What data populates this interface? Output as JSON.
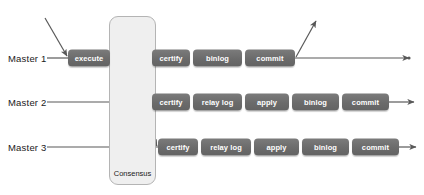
{
  "diagram": {
    "consensus": {
      "label": "Consensus",
      "x": 109,
      "y": 16,
      "width": 47,
      "height": 169,
      "label_x": 109,
      "label_y": 169,
      "label_width": 47
    },
    "rows": [
      {
        "id": "master-1",
        "label": "Master 1",
        "label_x": 8,
        "y": 58,
        "stages": [
          {
            "name": "execute",
            "x": 68,
            "width": 42
          },
          {
            "name": "certify",
            "x": 152,
            "width": 38
          },
          {
            "name": "binlog",
            "x": 193,
            "width": 49
          },
          {
            "name": "commit",
            "x": 245,
            "width": 50
          }
        ]
      },
      {
        "id": "master-2",
        "label": "Master 2",
        "label_x": 8,
        "y": 102,
        "stages": [
          {
            "name": "certify",
            "x": 152,
            "width": 38
          },
          {
            "name": "relay log",
            "x": 193,
            "width": 49
          },
          {
            "name": "apply",
            "x": 245,
            "width": 44
          },
          {
            "name": "binlog",
            "x": 292,
            "width": 47
          },
          {
            "name": "commit",
            "x": 342,
            "width": 47
          }
        ]
      },
      {
        "id": "master-3",
        "label": "Master 3",
        "label_x": 8,
        "y": 147,
        "stages": [
          {
            "name": "certify",
            "x": 158,
            "width": 40
          },
          {
            "name": "relay log",
            "x": 201,
            "width": 50
          },
          {
            "name": "apply",
            "x": 254,
            "width": 45
          },
          {
            "name": "binlog",
            "x": 302,
            "width": 47
          },
          {
            "name": "commit",
            "x": 352,
            "width": 47
          }
        ]
      }
    ],
    "connectors": [
      {
        "id": "input-arrow-master-1",
        "kind": "arrow",
        "x1": 45,
        "y1": 18,
        "x2": 67,
        "y2": 56
      },
      {
        "id": "label-line-master-1",
        "kind": "line",
        "x1": 47,
        "y1": 58,
        "x2": 68,
        "y2": 58
      },
      {
        "id": "label-line-master-2",
        "kind": "line",
        "x1": 47,
        "y1": 102,
        "x2": 152,
        "y2": 102
      },
      {
        "id": "label-line-master-3",
        "kind": "line",
        "x1": 47,
        "y1": 147,
        "x2": 158,
        "y2": 147
      },
      {
        "id": "execute-to-certify-master-1",
        "kind": "line",
        "x1": 110,
        "y1": 58,
        "x2": 152,
        "y2": 58
      },
      {
        "id": "consensus-arc-master-1",
        "kind": "arc",
        "x1": 112,
        "y1": 57,
        "cx": 132,
        "cy": 8,
        "x2": 150,
        "y2": 59
      },
      {
        "id": "execute-to-certify-master-2",
        "kind": "arrow",
        "x1": 113,
        "y1": 59,
        "x2": 151,
        "y2": 101
      },
      {
        "id": "execute-to-certify-master-3",
        "kind": "arrow",
        "x1": 113,
        "y1": 60,
        "x2": 157,
        "y2": 146
      },
      {
        "id": "commit-out-master-1",
        "kind": "arrow-dot",
        "x1": 295,
        "y1": 58,
        "x2": 409,
        "y2": 58
      },
      {
        "id": "commit-up-master-1",
        "kind": "arrow",
        "x1": 296,
        "y1": 57,
        "x2": 316,
        "y2": 21
      },
      {
        "id": "commit-out-master-2",
        "kind": "arrow",
        "x1": 389,
        "y1": 102,
        "x2": 414,
        "y2": 102
      },
      {
        "id": "commit-out-master-3",
        "kind": "arrow",
        "x1": 399,
        "y1": 147,
        "x2": 416,
        "y2": 147
      }
    ],
    "colors": {
      "box_fill": "#6b6b6b",
      "box_text": "#ffffff",
      "consensus_fill": "#efefef",
      "consensus_border": "#b4b4b4",
      "line": "#595959",
      "label_text": "#1a1a1a"
    }
  }
}
